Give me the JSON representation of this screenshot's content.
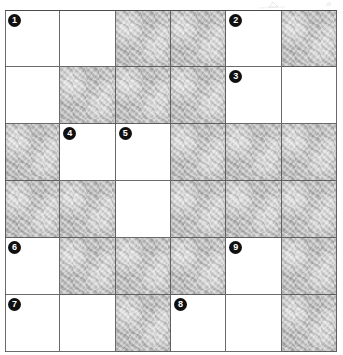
{
  "puzzle": {
    "title": "Crossword Grid",
    "rows": 6,
    "columns": 6,
    "colors": {
      "open_cell": "#ffffff",
      "blocked_cell": "#b0b0b0",
      "grid_line": "#4a4a4a",
      "clue_number_background": "#101010",
      "clue_number_text": "#ffffff"
    },
    "legend": {
      "open": "white answer square",
      "blocked": "pencil-shaded blocked square"
    },
    "cells": [
      {
        "row": 1,
        "col": 1,
        "state": "open",
        "number": "1"
      },
      {
        "row": 1,
        "col": 2,
        "state": "open",
        "number": ""
      },
      {
        "row": 1,
        "col": 3,
        "state": "blocked",
        "number": ""
      },
      {
        "row": 1,
        "col": 4,
        "state": "blocked",
        "number": ""
      },
      {
        "row": 1,
        "col": 5,
        "state": "open",
        "number": "2"
      },
      {
        "row": 1,
        "col": 6,
        "state": "blocked",
        "number": ""
      },
      {
        "row": 2,
        "col": 1,
        "state": "open",
        "number": ""
      },
      {
        "row": 2,
        "col": 2,
        "state": "blocked",
        "number": ""
      },
      {
        "row": 2,
        "col": 3,
        "state": "blocked",
        "number": ""
      },
      {
        "row": 2,
        "col": 4,
        "state": "blocked",
        "number": ""
      },
      {
        "row": 2,
        "col": 5,
        "state": "open",
        "number": "3"
      },
      {
        "row": 2,
        "col": 6,
        "state": "open",
        "number": ""
      },
      {
        "row": 3,
        "col": 1,
        "state": "blocked",
        "number": ""
      },
      {
        "row": 3,
        "col": 2,
        "state": "open",
        "number": "4"
      },
      {
        "row": 3,
        "col": 3,
        "state": "open",
        "number": "5"
      },
      {
        "row": 3,
        "col": 4,
        "state": "blocked",
        "number": ""
      },
      {
        "row": 3,
        "col": 5,
        "state": "blocked",
        "number": ""
      },
      {
        "row": 3,
        "col": 6,
        "state": "blocked",
        "number": ""
      },
      {
        "row": 4,
        "col": 1,
        "state": "blocked",
        "number": ""
      },
      {
        "row": 4,
        "col": 2,
        "state": "blocked",
        "number": ""
      },
      {
        "row": 4,
        "col": 3,
        "state": "open",
        "number": ""
      },
      {
        "row": 4,
        "col": 4,
        "state": "blocked",
        "number": ""
      },
      {
        "row": 4,
        "col": 5,
        "state": "blocked",
        "number": ""
      },
      {
        "row": 4,
        "col": 6,
        "state": "blocked",
        "number": ""
      },
      {
        "row": 5,
        "col": 1,
        "state": "open",
        "number": "6"
      },
      {
        "row": 5,
        "col": 2,
        "state": "blocked",
        "number": ""
      },
      {
        "row": 5,
        "col": 3,
        "state": "blocked",
        "number": ""
      },
      {
        "row": 5,
        "col": 4,
        "state": "blocked",
        "number": ""
      },
      {
        "row": 5,
        "col": 5,
        "state": "open",
        "number": "9"
      },
      {
        "row": 5,
        "col": 6,
        "state": "blocked",
        "number": ""
      },
      {
        "row": 6,
        "col": 1,
        "state": "open",
        "number": "7"
      },
      {
        "row": 6,
        "col": 2,
        "state": "open",
        "number": ""
      },
      {
        "row": 6,
        "col": 3,
        "state": "blocked",
        "number": ""
      },
      {
        "row": 6,
        "col": 4,
        "state": "open",
        "number": "8"
      },
      {
        "row": 6,
        "col": 5,
        "state": "open",
        "number": ""
      },
      {
        "row": 6,
        "col": 6,
        "state": "blocked",
        "number": ""
      }
    ]
  }
}
